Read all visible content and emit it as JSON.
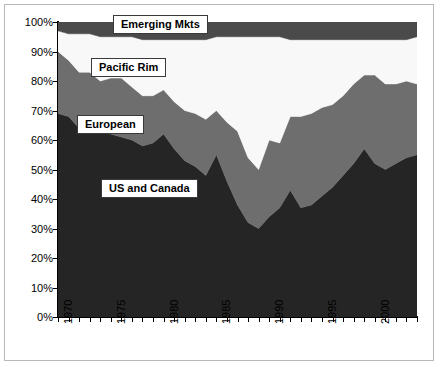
{
  "chart_data": {
    "type": "area",
    "subtype": "100% stacked area",
    "title": "",
    "xlabel": "",
    "ylabel": "",
    "ylim": [
      0,
      100
    ],
    "xlim": [
      1970,
      2004
    ],
    "grid": false,
    "legend_position": "inline-labels",
    "y_tick_labels": [
      "100%",
      "90%",
      "80%",
      "70%",
      "60%",
      "50%",
      "40%",
      "30%",
      "20%",
      "10%",
      "0%"
    ],
    "y_tick_values": [
      100,
      90,
      80,
      70,
      60,
      50,
      40,
      30,
      20,
      10,
      0
    ],
    "x_tick_labels": [
      "1970",
      "1975",
      "1980",
      "1985",
      "1990",
      "1995",
      "2000"
    ],
    "x_tick_values": [
      1970,
      1975,
      1980,
      1985,
      1990,
      1995,
      2000
    ],
    "x_minor_tick_interval": 1,
    "x": [
      1970,
      1971,
      1972,
      1973,
      1974,
      1975,
      1976,
      1977,
      1978,
      1979,
      1980,
      1981,
      1982,
      1983,
      1984,
      1985,
      1986,
      1987,
      1988,
      1989,
      1990,
      1991,
      1992,
      1993,
      1994,
      1995,
      1996,
      1997,
      1998,
      1999,
      2000,
      2001,
      2002,
      2003,
      2004
    ],
    "series": [
      {
        "name": "US and Canada",
        "color": "#252525",
        "label_text": "US and Canada",
        "values": [
          69,
          68,
          64,
          65,
          63,
          62,
          61,
          60,
          58,
          59,
          62,
          57,
          53,
          51,
          48,
          55,
          46,
          38,
          32,
          30,
          34,
          37,
          43,
          37,
          38,
          41,
          44,
          48,
          52,
          57,
          52,
          50,
          52,
          54,
          55
        ]
      },
      {
        "name": "European",
        "color": "#6e6e6e",
        "label_text": "European",
        "values": [
          21,
          19,
          19,
          18,
          17,
          19,
          20,
          18,
          17,
          16,
          15,
          16,
          17,
          18,
          19,
          15,
          20,
          25,
          22,
          20,
          26,
          22,
          25,
          31,
          31,
          30,
          28,
          27,
          27,
          25,
          30,
          29,
          27,
          26,
          24
        ]
      },
      {
        "name": "Pacific Rim",
        "color": "#f8f8f8",
        "label_text": "Pacific Rim",
        "values": [
          7,
          9,
          13,
          13,
          15,
          14,
          14,
          17,
          19,
          19,
          17,
          21,
          24,
          25,
          27,
          25,
          29,
          32,
          41,
          45,
          35,
          36,
          26,
          26,
          25,
          23,
          22,
          19,
          15,
          12,
          12,
          15,
          15,
          14,
          16
        ]
      },
      {
        "name": "Emerging Mkts",
        "color": "#4a4a4a",
        "label_text": "Emerging Mkts",
        "values": [
          3,
          4,
          4,
          4,
          5,
          5,
          5,
          5,
          6,
          6,
          6,
          6,
          6,
          6,
          6,
          5,
          5,
          5,
          5,
          5,
          5,
          5,
          6,
          6,
          6,
          6,
          6,
          6,
          6,
          6,
          6,
          6,
          6,
          6,
          5
        ]
      }
    ]
  },
  "frame": {
    "border_color": "#b8b8b8",
    "background": "#ffffff",
    "axis_color": "#000000"
  }
}
